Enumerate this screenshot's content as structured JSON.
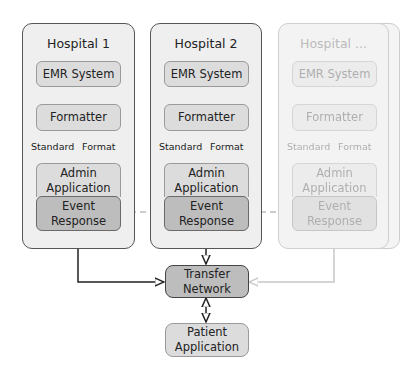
{
  "diagram": {
    "hospitals": [
      {
        "title": "Hospital 1",
        "nodes": {
          "emr": "EMR System",
          "formatter": "Formatter",
          "admin_line1": "Admin",
          "admin_line2": "Application",
          "event_line1": "Event",
          "event_line2": "Response"
        },
        "edge_label_left": "Standard",
        "edge_label_right": "Format"
      },
      {
        "title": "Hospital 2",
        "nodes": {
          "emr": "EMR System",
          "formatter": "Formatter",
          "admin_line1": "Admin",
          "admin_line2": "Application",
          "event_line1": "Event",
          "event_line2": "Response"
        },
        "edge_label_left": "Standard",
        "edge_label_right": "Format"
      },
      {
        "title": "Hospital ...",
        "nodes": {
          "emr": "EMR System",
          "formatter": "Formatter",
          "admin_line1": "Admin",
          "admin_line2": "Application",
          "event_line1": "Event",
          "event_line2": "Response"
        },
        "edge_label_left": "Standard",
        "edge_label_right": "Format"
      }
    ],
    "transfer_network": {
      "line1": "Transfer",
      "line2": "Network"
    },
    "patient_application": {
      "line1": "Patient",
      "line2": "Application"
    },
    "colors": {
      "container_bg": "#efefef",
      "node_bg": "#dcdcdc",
      "node_dark_bg": "#bdbdbd",
      "edge": "#222222",
      "dashed_edge": "#999999"
    }
  }
}
